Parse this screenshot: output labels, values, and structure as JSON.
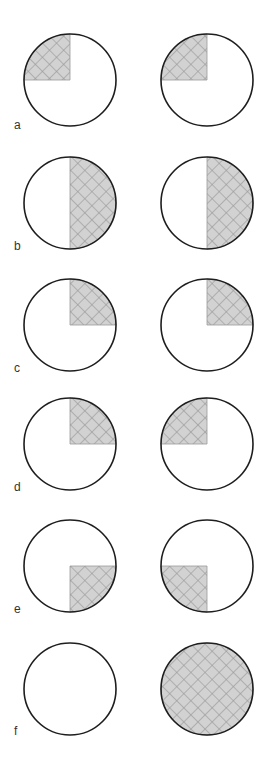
{
  "figure": {
    "width": 272,
    "height": 766,
    "radius": 46,
    "left_cx": 70,
    "right_cx": 207,
    "colors": {
      "outline": "#1e1e1e",
      "hatch_fill": "#d2d2d2",
      "hatch_line": "#9a9a9a",
      "label": "#333333",
      "background": "#ffffff"
    },
    "rows": [
      {
        "label": "a",
        "cy": 80,
        "label_y": 129,
        "left": "top-left",
        "right": "top-left"
      },
      {
        "label": "b",
        "cy": 203,
        "label_y": 250,
        "left": "right-half",
        "right": "right-half"
      },
      {
        "label": "c",
        "cy": 325,
        "label_y": 372,
        "left": "top-right",
        "right": "top-right"
      },
      {
        "label": "d",
        "cy": 444,
        "label_y": 491,
        "left": "top-right",
        "right": "top-left"
      },
      {
        "label": "e",
        "cy": 566,
        "label_y": 613,
        "left": "bottom-right",
        "right": "bottom-left"
      },
      {
        "label": "f",
        "cy": 689,
        "label_y": 735,
        "left": "none",
        "right": "full"
      }
    ]
  }
}
